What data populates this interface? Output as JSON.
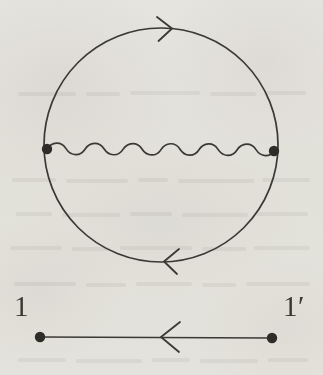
{
  "figure": {
    "kind": "feynman-diagram",
    "background_color": "#f1f0ed",
    "ink_color": "#3b3935",
    "dot_color": "#2e2c29"
  },
  "labels": {
    "left_endpoint": "1",
    "right_endpoint_base": "1",
    "right_endpoint_prime": "′",
    "right_endpoint": "1′"
  },
  "loop": {
    "name": "fermion-loop",
    "center_x": 161,
    "center_y": 145,
    "radius": 117,
    "stroke_width": 1.7,
    "direction": "clockwise",
    "arrows": [
      {
        "name": "loop-arrow-top",
        "position": "top",
        "points": "right",
        "x": 168,
        "y": 28
      },
      {
        "name": "loop-arrow-bottom",
        "position": "bottom",
        "points": "left",
        "x": 168,
        "y": 262
      }
    ]
  },
  "interaction": {
    "name": "wavy-interaction-line",
    "style": "wavy",
    "x_start": 47,
    "x_end": 274,
    "y": 150,
    "amplitude": 5.5,
    "periods": 6,
    "stroke_width": 1.7
  },
  "vertices": [
    {
      "name": "loop-vertex-left",
      "x": 47,
      "y": 149,
      "radius": 5.2
    },
    {
      "name": "loop-vertex-right",
      "x": 274,
      "y": 151,
      "radius": 5.2
    }
  ],
  "propagator": {
    "name": "external-propagator-line",
    "x_start": 40,
    "x_end": 272,
    "y": 337,
    "stroke_width": 1.7,
    "arrow": {
      "name": "propagator-arrow",
      "points": "left",
      "x": 165,
      "y": 337
    },
    "endpoints": [
      {
        "name": "propagator-endpoint-left",
        "x": 40,
        "y": 337,
        "radius": 5.2
      },
      {
        "name": "propagator-endpoint-right",
        "x": 272,
        "y": 338,
        "radius": 5.2
      }
    ]
  }
}
